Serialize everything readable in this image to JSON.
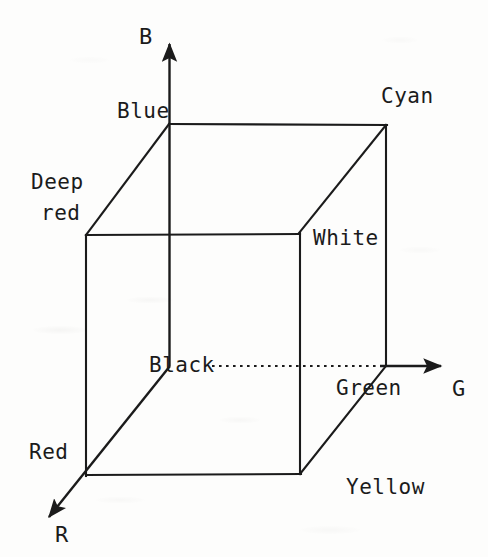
{
  "figure": {
    "type": "rgb-color-cube",
    "background_color": "#fdfdfc",
    "line_color": "#1b1b1b",
    "axes": [
      {
        "name": "blue-axis",
        "label": "B",
        "direction": "up",
        "label_x": 139,
        "label_y": 26
      },
      {
        "name": "green-axis",
        "label": "G",
        "direction": "right",
        "label_x": 452,
        "label_y": 378
      },
      {
        "name": "red-axis",
        "label": "R",
        "direction": "down-left",
        "label_x": 55,
        "label_y": 524
      }
    ],
    "vertices": [
      {
        "name": "black",
        "label": "Black",
        "label_x": 149,
        "label_y": 355,
        "x": 170,
        "y": 366
      },
      {
        "name": "blue",
        "label": "Blue",
        "label_x": 117,
        "label_y": 101,
        "x": 169,
        "y": 124
      },
      {
        "name": "green",
        "label": "Green",
        "label_x": 336,
        "label_y": 378,
        "x": 386,
        "y": 366
      },
      {
        "name": "red",
        "label": "Red",
        "label_x": 29,
        "label_y": 442,
        "x": 86,
        "y": 475
      },
      {
        "name": "cyan",
        "label": "Cyan",
        "label_x": 381,
        "label_y": 86,
        "x": 386,
        "y": 125
      },
      {
        "name": "deep-red",
        "label": "Deep\nred",
        "label_line_1": "Deep",
        "label_line_2": "red",
        "label_x": 31,
        "label_y": 172,
        "x": 86,
        "y": 235
      },
      {
        "name": "white",
        "label": "White",
        "label_x": 313,
        "label_y": 228,
        "x": 299,
        "y": 233
      },
      {
        "name": "yellow",
        "label": "Yellow",
        "label_x": 346,
        "label_y": 477,
        "x": 300,
        "y": 473
      }
    ],
    "edges": [
      {
        "from": "blue",
        "to": "cyan",
        "style": "solid"
      },
      {
        "from": "blue",
        "to": "deep-red",
        "style": "solid"
      },
      {
        "from": "blue",
        "to": "black",
        "style": "solid"
      },
      {
        "from": "cyan",
        "to": "white",
        "style": "solid"
      },
      {
        "from": "cyan",
        "to": "green",
        "style": "solid"
      },
      {
        "from": "deep-red",
        "to": "white",
        "style": "solid"
      },
      {
        "from": "deep-red",
        "to": "red",
        "style": "solid"
      },
      {
        "from": "white",
        "to": "yellow",
        "style": "solid"
      },
      {
        "from": "black",
        "to": "green",
        "style": "dotted"
      },
      {
        "from": "black",
        "to": "red",
        "style": "solid"
      },
      {
        "from": "green",
        "to": "yellow",
        "style": "solid"
      },
      {
        "from": "red",
        "to": "yellow",
        "style": "solid"
      }
    ]
  }
}
